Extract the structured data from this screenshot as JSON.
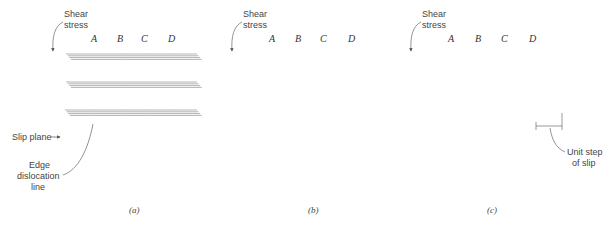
{
  "figure": {
    "panels": [
      {
        "id": "a",
        "caption": "(a)",
        "shear_label_line1": "Shear",
        "shear_label_line2": "stress",
        "columns": [
          "A",
          "B",
          "C",
          "D"
        ],
        "annotations": {
          "slip_plane": "Slip plane",
          "edge_line1": "Edge",
          "edge_line2": "dislocation",
          "edge_line3": "line"
        }
      },
      {
        "id": "b",
        "caption": "(b)",
        "shear_label_line1": "Shear",
        "shear_label_line2": "stress",
        "columns": [
          "A",
          "B",
          "C",
          "D"
        ]
      },
      {
        "id": "c",
        "caption": "(c)",
        "shear_label_line1": "Shear",
        "shear_label_line2": "stress",
        "columns": [
          "A",
          "B",
          "C",
          "D"
        ],
        "annotations": {
          "unit_step_line1": "Unit step",
          "unit_step_line2": "of slip"
        }
      }
    ],
    "colors": {
      "atom_fill": "#f2f2f2",
      "atom_stroke": "#555555",
      "bond": "#666666",
      "dark_bond": "#333333"
    }
  }
}
